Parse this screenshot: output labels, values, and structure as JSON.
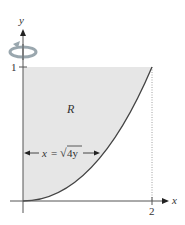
{
  "figure": {
    "x_axis_label": "x",
    "y_axis_label": "y",
    "y_tick_label": "1",
    "x_tick_label": "2",
    "region_label": "R",
    "equation_label": "x = √4y",
    "equation_parts": {
      "lhs": "x",
      "eq": "=",
      "radical": "√",
      "radicand": "4y"
    },
    "rotation_icon": "rotation-about-y-axis-icon",
    "colors": {
      "region_fill": "#e6e6e6",
      "axis": "#555555",
      "curve": "#444444",
      "rotation_arrow": "#9aa7ae",
      "dotted_guide": "#888888"
    }
  }
}
